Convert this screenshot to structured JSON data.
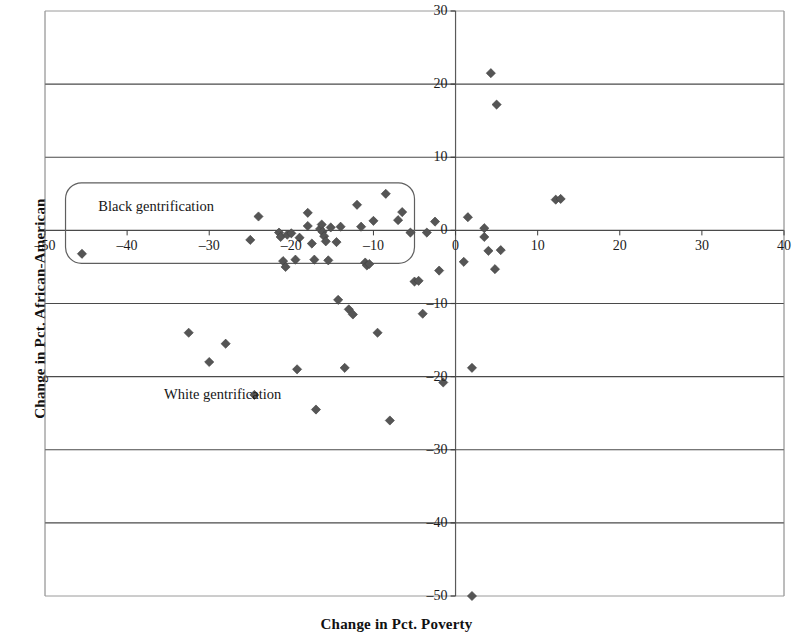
{
  "chart_data": {
    "type": "scatter",
    "title": "",
    "xlabel": "Change in Pct. Poverty",
    "ylabel": "Change in Pct. African-American",
    "xlim": [
      -50,
      40
    ],
    "ylim": [
      -50,
      30
    ],
    "xticks": [
      -50,
      -40,
      -30,
      -20,
      -10,
      0,
      10,
      20,
      30,
      40
    ],
    "xticklabels": [
      "–50",
      "–40",
      "–30",
      "–20",
      "–10",
      "0",
      "10",
      "20",
      "30",
      "40"
    ],
    "yticks": [
      -50,
      -40,
      -30,
      -20,
      -10,
      0,
      10,
      20,
      30
    ],
    "yticklabels": [
      "–50",
      "–40",
      "–30",
      "–20",
      "–10",
      "0",
      "10",
      "20",
      "30"
    ],
    "grid": "horizontal",
    "gridlines_y": [
      -40,
      -30,
      -20,
      -10,
      0,
      10,
      20
    ],
    "marker": "diamond",
    "marker_color": "#555555",
    "legend": null,
    "annotations": [
      {
        "name": "black-gentrification",
        "text": "Black gentrification",
        "shape": "rounded-rectangle",
        "x_range": [
          -47.5,
          -5.0
        ],
        "y_range": [
          -4.5,
          6.5
        ],
        "text_x": -43.5,
        "text_y": 3.2
      },
      {
        "name": "white-gentrification",
        "text": "White gentrification",
        "shape": "text",
        "text_x": -35.5,
        "text_y": -22.5
      }
    ],
    "points": [
      {
        "x": -45.5,
        "y": -3.2
      },
      {
        "x": -32.5,
        "y": -14.0
      },
      {
        "x": -30.0,
        "y": -18.0
      },
      {
        "x": -28.0,
        "y": -15.5
      },
      {
        "x": -25.0,
        "y": -1.3
      },
      {
        "x": -24.5,
        "y": -22.5
      },
      {
        "x": -24.0,
        "y": 1.9
      },
      {
        "x": -21.5,
        "y": -0.3
      },
      {
        "x": -21.3,
        "y": -0.9
      },
      {
        "x": -21.0,
        "y": -4.2
      },
      {
        "x": -20.7,
        "y": -5.0
      },
      {
        "x": -20.5,
        "y": -0.6
      },
      {
        "x": -20.0,
        "y": -0.4
      },
      {
        "x": -19.5,
        "y": -4.0
      },
      {
        "x": -19.3,
        "y": -19.0
      },
      {
        "x": -19.0,
        "y": -1.0
      },
      {
        "x": -18.0,
        "y": 2.4
      },
      {
        "x": -18.0,
        "y": 0.6
      },
      {
        "x": -17.5,
        "y": -1.8
      },
      {
        "x": -17.2,
        "y": -4.0
      },
      {
        "x": -17.0,
        "y": -24.5
      },
      {
        "x": -16.5,
        "y": 0.2
      },
      {
        "x": -16.3,
        "y": 0.8
      },
      {
        "x": -16.2,
        "y": -0.2
      },
      {
        "x": -16.0,
        "y": -0.8
      },
      {
        "x": -15.8,
        "y": -1.5
      },
      {
        "x": -15.5,
        "y": -4.1
      },
      {
        "x": -15.2,
        "y": 0.4
      },
      {
        "x": -14.5,
        "y": -1.6
      },
      {
        "x": -14.3,
        "y": -9.5
      },
      {
        "x": -14.0,
        "y": 0.5
      },
      {
        "x": -13.5,
        "y": -18.8
      },
      {
        "x": -13.0,
        "y": -10.8
      },
      {
        "x": -12.5,
        "y": -11.5
      },
      {
        "x": -12.0,
        "y": 3.5
      },
      {
        "x": -11.5,
        "y": 0.5
      },
      {
        "x": -11.0,
        "y": -4.4
      },
      {
        "x": -10.8,
        "y": -4.8
      },
      {
        "x": -10.5,
        "y": -4.6
      },
      {
        "x": -10.0,
        "y": 1.3
      },
      {
        "x": -9.5,
        "y": -14.0
      },
      {
        "x": -8.5,
        "y": 5.0
      },
      {
        "x": -8.0,
        "y": -26.0
      },
      {
        "x": -7.0,
        "y": 1.4
      },
      {
        "x": -6.5,
        "y": 2.5
      },
      {
        "x": -5.5,
        "y": -0.3
      },
      {
        "x": -5.0,
        "y": -7.0
      },
      {
        "x": -4.5,
        "y": -6.9
      },
      {
        "x": -4.0,
        "y": -11.4
      },
      {
        "x": -3.5,
        "y": -0.3
      },
      {
        "x": -2.5,
        "y": 1.2
      },
      {
        "x": -2.0,
        "y": -5.5
      },
      {
        "x": -1.5,
        "y": -20.8
      },
      {
        "x": 1.0,
        "y": -4.3
      },
      {
        "x": 1.5,
        "y": 1.8
      },
      {
        "x": 2.0,
        "y": -18.8
      },
      {
        "x": 3.5,
        "y": 0.3
      },
      {
        "x": 3.5,
        "y": -0.9
      },
      {
        "x": 4.0,
        "y": -2.8
      },
      {
        "x": 4.3,
        "y": 21.5
      },
      {
        "x": 4.8,
        "y": -5.3
      },
      {
        "x": 5.0,
        "y": 17.2
      },
      {
        "x": 5.5,
        "y": -2.7
      },
      {
        "x": 2.0,
        "y": -50.0
      },
      {
        "x": 12.2,
        "y": 4.2
      },
      {
        "x": 12.8,
        "y": 4.3
      }
    ]
  },
  "plot_geometry": {
    "left_px": 45,
    "right_px": 784,
    "top_px": 11,
    "bottom_px": 596
  }
}
